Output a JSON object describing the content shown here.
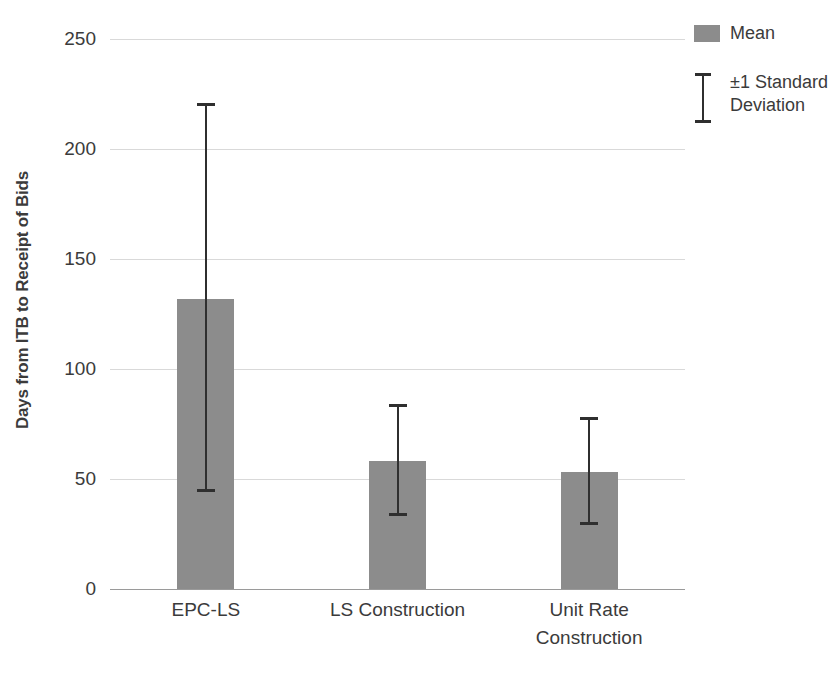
{
  "chart_data": {
    "type": "bar",
    "title": "",
    "xlabel": "",
    "ylabel": "Days from ITB to Receipt of Bids",
    "ylim": [
      0,
      250
    ],
    "yticks": [
      0,
      50,
      100,
      150,
      200,
      250
    ],
    "ytick_labels": [
      "0",
      "50",
      "100",
      "150",
      "200",
      "250"
    ],
    "grid": true,
    "legend_position": "right",
    "categories": [
      "EPC-LS",
      "LS Construction",
      "Unit Rate Construction"
    ],
    "category_label_lines": [
      [
        "EPC-LS"
      ],
      [
        "LS Construction"
      ],
      [
        "Unit Rate",
        "Construction"
      ]
    ],
    "series": [
      {
        "name": "Mean",
        "values": [
          132,
          58,
          53
        ],
        "error_upper": [
          221,
          84,
          78
        ],
        "error_lower": [
          44,
          33,
          29
        ],
        "color": "#8c8c8c"
      }
    ],
    "legend": [
      {
        "label": "Mean",
        "marker": "swatch",
        "color": "#8c8c8c"
      },
      {
        "label": "±1 Standard Deviation",
        "marker": "errorbar",
        "color": "#2f2f2f"
      }
    ],
    "legend_entries_text": {
      "mean": "Mean",
      "std_line1": "±1 Standard",
      "std_line2": "Deviation"
    },
    "colors": {
      "bar": "#8c8c8c",
      "error": "#2f2f2f",
      "grid": "#d9d9d9",
      "axis": "#8f8f8f",
      "text": "#3b3b3b",
      "background": "#ffffff"
    }
  }
}
